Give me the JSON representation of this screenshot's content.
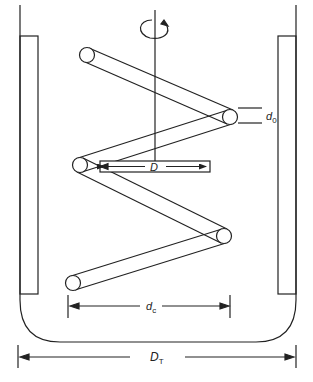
{
  "diagram": {
    "colors": {
      "stroke": "#222222",
      "background": "#ffffff"
    },
    "labels": {
      "d0": {
        "main": "d",
        "sub": "0"
      },
      "D": {
        "main": "D"
      },
      "dc": {
        "main": "d",
        "sub": "c"
      },
      "DT": {
        "main": "D",
        "sub": "T"
      }
    },
    "components": [
      "rotation-arrow",
      "shaft",
      "helical-coil",
      "impeller-bar",
      "left-baffle",
      "right-baffle",
      "tank-wall"
    ]
  }
}
